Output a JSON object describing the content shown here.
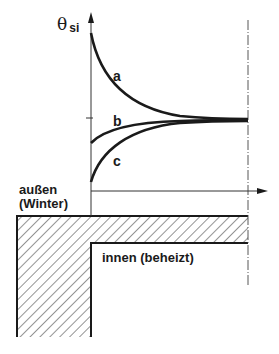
{
  "diagram": {
    "y_axis_label": "θ",
    "y_axis_subscript": "si",
    "curves": [
      {
        "id": "a",
        "label": "a",
        "description": "falls from high value to equilibrium"
      },
      {
        "id": "b",
        "label": "b",
        "description": "rises slightly to equilibrium"
      },
      {
        "id": "c",
        "label": "c",
        "description": "rises from low value to equilibrium"
      }
    ],
    "outside_label_line1": "außen",
    "outside_label_line2": "(Winter)",
    "inside_label": "innen (beheizt)",
    "colors": {
      "line": "#1a1a1a",
      "axis": "#333333",
      "hatch": "#3a3a3a",
      "background": "#ffffff"
    }
  }
}
